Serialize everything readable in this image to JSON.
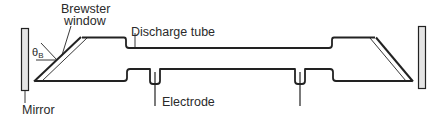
{
  "diagram": {
    "labels": {
      "brewster_window_line1": "Brewster",
      "brewster_window_line2": "window",
      "discharge_tube": "Discharge tube",
      "electrode": "Electrode",
      "mirror": "Mirror",
      "brewster_angle_symbol": "θ",
      "brewster_angle_subscript": "B"
    },
    "colors": {
      "stroke": "#222222",
      "mirror_fill": "#e4e4e4",
      "background": "#ffffff"
    },
    "components": [
      {
        "name": "left-mirror",
        "type": "mirror"
      },
      {
        "name": "left-brewster-window",
        "type": "window"
      },
      {
        "name": "discharge-tube",
        "type": "tube"
      },
      {
        "name": "electrode-left",
        "type": "electrode"
      },
      {
        "name": "electrode-right",
        "type": "electrode"
      },
      {
        "name": "right-brewster-window",
        "type": "window"
      },
      {
        "name": "right-mirror",
        "type": "mirror"
      }
    ]
  }
}
